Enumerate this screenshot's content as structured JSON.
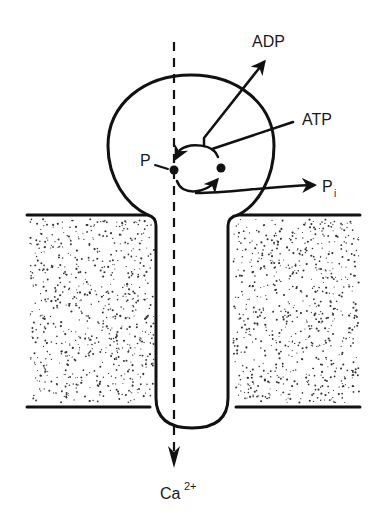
{
  "diagram": {
    "labels": {
      "adp": "ADP",
      "atp": "ATP",
      "pi_main": "P",
      "pi_sub": "i",
      "p": "P",
      "ca_main": "Ca",
      "ca_sup": "2+"
    },
    "flow_direction": "downward through channel",
    "colors": {
      "ink": "#111111",
      "background": "#ffffff",
      "stipple": "#333333"
    }
  }
}
